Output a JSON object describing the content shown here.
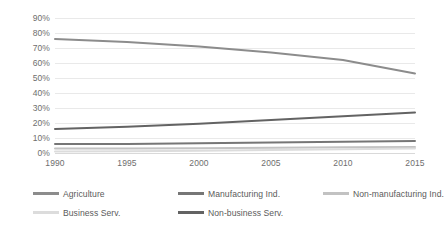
{
  "chart_data": {
    "type": "line",
    "title": "",
    "subtitle": "",
    "xlabel": "",
    "ylabel": "",
    "x": [
      1990,
      1995,
      2000,
      2005,
      2010,
      2015
    ],
    "xtick_labels": [
      "1990",
      "1995",
      "2000",
      "2005",
      "2010",
      "2015"
    ],
    "xlim": [
      1990,
      2015
    ],
    "ylim": [
      0,
      90
    ],
    "ytick_labels": [
      "90%",
      "80%",
      "70%",
      "60%",
      "50%",
      "40%",
      "30%",
      "20%",
      "10%",
      "0%"
    ],
    "ytick_values": [
      90,
      80,
      70,
      60,
      50,
      40,
      30,
      20,
      10,
      0
    ],
    "grid": "horizontal",
    "legend_position": "bottom",
    "series": [
      {
        "name": "Agriculture",
        "color": "#8c8c8c",
        "values": [
          76,
          74,
          71,
          67,
          62,
          53
        ]
      },
      {
        "name": "Manufacturing Ind.",
        "color": "#767676",
        "values": [
          6,
          6,
          6.5,
          7,
          7.5,
          8
        ]
      },
      {
        "name": "Non-manufacturing Ind.",
        "color": "#c2c2c2",
        "values": [
          3,
          3,
          3.2,
          3.5,
          3.8,
          4
        ]
      },
      {
        "name": "Business Serv.",
        "color": "#dcdcdc",
        "values": [
          1,
          1.2,
          1.5,
          2,
          2.5,
          3
        ]
      },
      {
        "name": "Non-business Serv.",
        "color": "#636363",
        "values": [
          16,
          17.5,
          19.5,
          22,
          24.5,
          27
        ]
      }
    ]
  },
  "style": {
    "grid_color": "#e9e9e9",
    "axis_color": "#d9d9d9",
    "tick_text_color": "#6e6e6e",
    "legend_text_color": "#5b5b5b",
    "background": "#ffffff"
  }
}
